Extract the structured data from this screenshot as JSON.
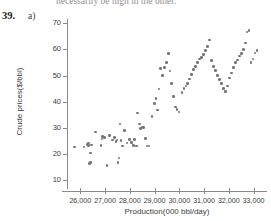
{
  "page": {
    "cut_text": "necessarily be high in the other.",
    "exercise_number": "39.",
    "exercise_part": "a)"
  },
  "colors": {
    "point": "#76767a",
    "axis": "#8a8a8a",
    "text": "#3c3c3c",
    "background": "#ffffff"
  },
  "chart_data": {
    "type": "scatter",
    "title": "",
    "subtitle": "",
    "xlabel": "Production(000 bbl/day)",
    "ylabel": "Crude prices($/bbl)",
    "xlim": [
      25500,
      33500
    ],
    "ylim": [
      7,
      72
    ],
    "grid": false,
    "legend": null,
    "xticks": [
      26000,
      27000,
      28000,
      29000,
      30000,
      31000,
      32000,
      33000
    ],
    "xtick_labels": [
      "26,000",
      "27,000",
      "28,000",
      "29,000",
      "30,000",
      "31,000",
      "32,000",
      "33,000"
    ],
    "yticks": [
      10,
      20,
      30,
      40,
      50,
      60,
      70
    ],
    "ytick_labels": [
      "10",
      "20",
      "30",
      "40",
      "50",
      "60",
      "70"
    ],
    "marker": "circle",
    "marker_size": 2.6,
    "series": [
      {
        "name": "Crude price vs production",
        "color": "#76767a",
        "x": [
          25760,
          26140,
          26290,
          26330,
          26340,
          26380,
          26400,
          26410,
          26450,
          26600,
          26830,
          26870,
          26890,
          26980,
          27080,
          27180,
          27290,
          27380,
          27440,
          27480,
          27520,
          27560,
          27600,
          27640,
          27700,
          27780,
          27880,
          27980,
          28060,
          28140,
          28180,
          28260,
          28300,
          28380,
          28440,
          28520,
          28560,
          28640,
          28700,
          28780,
          28900,
          29000,
          29060,
          29120,
          29180,
          29240,
          29320,
          29400,
          29480,
          29560,
          29620,
          29680,
          29760,
          29840,
          29900,
          29980,
          30100,
          30180,
          30260,
          30340,
          30420,
          30500,
          30580,
          30660,
          30740,
          30820,
          30900,
          30980,
          31060,
          31140,
          31220,
          31300,
          31380,
          31460,
          31540,
          31620,
          31700,
          31780,
          31860,
          31940,
          32020,
          32100,
          32180,
          32260,
          32340,
          32420,
          32500,
          32580,
          32660,
          32740,
          32820,
          32900,
          32980,
          33060,
          33140
        ],
        "y": [
          22.6,
          22.6,
          23.6,
          24.2,
          23.2,
          16.4,
          16.8,
          20.4,
          23.4,
          28.4,
          23.2,
          25.8,
          26.8,
          26.4,
          15.6,
          27.0,
          25.4,
          26.2,
          24.8,
          25.4,
          16.8,
          18.4,
          31.4,
          25.2,
          23.0,
          29.0,
          24.2,
          25.6,
          24.4,
          23.2,
          25.6,
          23.0,
          35.6,
          31.4,
          29.8,
          30.4,
          30.2,
          26.0,
          23.0,
          23.0,
          34.4,
          39.4,
          41.2,
          36.8,
          44.8,
          52.8,
          50.0,
          53.0,
          55.0,
          58.4,
          51.8,
          47.0,
          42.0,
          38.0,
          37.0,
          36.0,
          43.6,
          45.0,
          46.0,
          47.0,
          48.6,
          50.4,
          52.4,
          53.4,
          55.0,
          56.4,
          57.0,
          58.0,
          59.6,
          61.0,
          63.6,
          55.8,
          53.4,
          52.0,
          50.0,
          48.4,
          47.0,
          45.0,
          44.0,
          46.0,
          49.0,
          51.0,
          53.0,
          55.0,
          56.0,
          57.4,
          58.4,
          60.0,
          62.4,
          66.6,
          67.2,
          55.0,
          56.4,
          58.6,
          59.6
        ]
      }
    ]
  }
}
